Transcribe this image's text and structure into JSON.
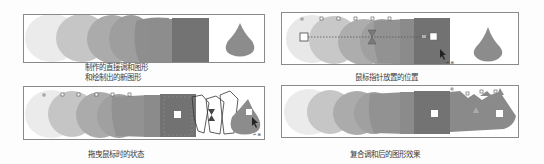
{
  "panels": [
    {
      "id": "blend-created",
      "caption_lines": [
        "制作的直接调和图形",
        "和绘制出的新图形"
      ]
    },
    {
      "id": "pointer-position",
      "caption_lines": [
        "鼠标指针放置的位置"
      ],
      "cursor_label": "+"
    },
    {
      "id": "dragging-state",
      "caption_lines": [
        "拖曳鼠标时的状态"
      ],
      "cursor_label": "+"
    },
    {
      "id": "compound-blend-result",
      "caption_lines": [
        "复合调和后的图形效果"
      ]
    }
  ],
  "colors": {
    "border": "#8a8a8a",
    "step1": "#e6e6e6",
    "step2": "#c4c4c4",
    "step3": "#a8a8a8",
    "step4": "#979797",
    "step5": "#8a8a8a",
    "step6": "#727272",
    "drop": "#8a8a8a"
  }
}
